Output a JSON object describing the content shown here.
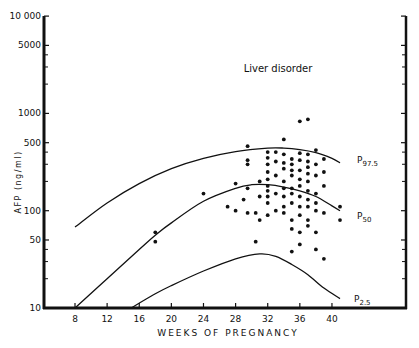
{
  "chart_data": {
    "type": "scatter",
    "title": "Liver disorder",
    "xlabel": "WEEKS OF PREGNANCY",
    "ylabel": "AFP (ng/ml)",
    "yscale": "log",
    "xlim": [
      4,
      46
    ],
    "ylim": [
      10,
      10000
    ],
    "x_ticks": [
      8,
      12,
      16,
      20,
      24,
      28,
      32,
      36,
      40
    ],
    "y_ticks": [
      10,
      50,
      100,
      500,
      1000,
      5000,
      10000
    ],
    "y_tick_labels": [
      "10",
      "50",
      "100",
      "500",
      "1000",
      "5000",
      "10 000"
    ],
    "grid": false,
    "series": [
      {
        "name": "P97.5",
        "label_main": "P",
        "label_sub": "97.5",
        "type": "line",
        "x": [
          8,
          12,
          16,
          20,
          24,
          28,
          32,
          34,
          36,
          38,
          40,
          41
        ],
        "y": [
          68,
          120,
          190,
          270,
          345,
          405,
          440,
          440,
          425,
          395,
          345,
          310
        ]
      },
      {
        "name": "P50",
        "label_main": "P",
        "label_sub": "50",
        "type": "line",
        "x": [
          8,
          12,
          16,
          18,
          20,
          24,
          28,
          30,
          32,
          34,
          36,
          38,
          40,
          41
        ],
        "y": [
          10,
          20,
          40,
          56,
          75,
          125,
          170,
          185,
          185,
          175,
          160,
          140,
          112,
          100
        ]
      },
      {
        "name": "P2.5",
        "label_main": "P",
        "label_sub": "2.5",
        "type": "line",
        "x": [
          15,
          18,
          20,
          24,
          28,
          31,
          33,
          35,
          37,
          39,
          41
        ],
        "y": [
          10,
          14,
          17,
          24,
          32,
          36,
          34,
          28,
          22,
          16,
          12.5
        ]
      },
      {
        "name": "Liver disorder cases",
        "type": "scatter",
        "points": [
          [
            18,
            60
          ],
          [
            18,
            48
          ],
          [
            24,
            150
          ],
          [
            27,
            110
          ],
          [
            28,
            100
          ],
          [
            28,
            190
          ],
          [
            29,
            130
          ],
          [
            29.5,
            460
          ],
          [
            29.5,
            330
          ],
          [
            29.5,
            300
          ],
          [
            29.5,
            170
          ],
          [
            29.5,
            95
          ],
          [
            30.5,
            95
          ],
          [
            30.5,
            48
          ],
          [
            31,
            200
          ],
          [
            31,
            140
          ],
          [
            31,
            80
          ],
          [
            32,
            400
          ],
          [
            32,
            350
          ],
          [
            32,
            300
          ],
          [
            32,
            250
          ],
          [
            32,
            210
          ],
          [
            32,
            180
          ],
          [
            32,
            160
          ],
          [
            32,
            140
          ],
          [
            32,
            120
          ],
          [
            32,
            90
          ],
          [
            33,
            400
          ],
          [
            33,
            320
          ],
          [
            33,
            230
          ],
          [
            33,
            150
          ],
          [
            33,
            100
          ],
          [
            34,
            540
          ],
          [
            34,
            380
          ],
          [
            34,
            310
          ],
          [
            34,
            270
          ],
          [
            34,
            200
          ],
          [
            34,
            170
          ],
          [
            34,
            140
          ],
          [
            34,
            110
          ],
          [
            34,
            95
          ],
          [
            35,
            340
          ],
          [
            35,
            300
          ],
          [
            35,
            260
          ],
          [
            35,
            230
          ],
          [
            35,
            170
          ],
          [
            35,
            150
          ],
          [
            35,
            120
          ],
          [
            35,
            80
          ],
          [
            35,
            65
          ],
          [
            35,
            38
          ],
          [
            36,
            830
          ],
          [
            36,
            390
          ],
          [
            36,
            330
          ],
          [
            36,
            260
          ],
          [
            36,
            210
          ],
          [
            36,
            180
          ],
          [
            36,
            140
          ],
          [
            36,
            110
          ],
          [
            36,
            90
          ],
          [
            36,
            60
          ],
          [
            36,
            45
          ],
          [
            37,
            870
          ],
          [
            37,
            380
          ],
          [
            37,
            320
          ],
          [
            37,
            280
          ],
          [
            37,
            240
          ],
          [
            37,
            200
          ],
          [
            37,
            160
          ],
          [
            37,
            130
          ],
          [
            37,
            110
          ],
          [
            37,
            80
          ],
          [
            37,
            70
          ],
          [
            38,
            420
          ],
          [
            38,
            300
          ],
          [
            38,
            230
          ],
          [
            38,
            150
          ],
          [
            38,
            120
          ],
          [
            38,
            100
          ],
          [
            38,
            60
          ],
          [
            38,
            40
          ],
          [
            39,
            340
          ],
          [
            39,
            250
          ],
          [
            39,
            180
          ],
          [
            39,
            95
          ],
          [
            39,
            32
          ],
          [
            41,
            110
          ],
          [
            41,
            80
          ]
        ]
      }
    ]
  }
}
